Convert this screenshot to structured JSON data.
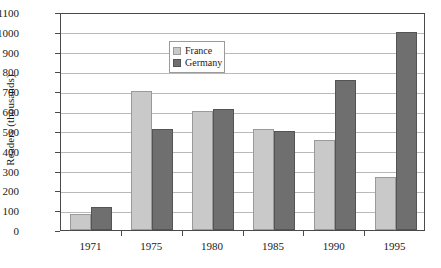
{
  "chart_data": {
    "type": "bar",
    "title": "",
    "subtitle": "",
    "xlabel": "",
    "ylabel": "Readers (thousands)",
    "categories": [
      "1971",
      "1975",
      "1980",
      "1985",
      "1990",
      "1995"
    ],
    "series": [
      {
        "name": "France",
        "color": "#c9c9c9",
        "values": [
          80,
          700,
          600,
          510,
          455,
          270
        ]
      },
      {
        "name": "Germany",
        "color": "#6f6f6f",
        "values": [
          115,
          510,
          610,
          500,
          755,
          1000
        ]
      }
    ],
    "ylim": [
      0,
      1100
    ],
    "ytick_step": 100,
    "yticks": [
      "1100",
      "1000",
      "900",
      "800",
      "700",
      "600",
      "500",
      "400",
      "300",
      "200",
      "100",
      "0"
    ],
    "grid": "horizontal",
    "legend_position": "top-left-inside",
    "legend_entries": [
      "France",
      "Germany"
    ]
  }
}
